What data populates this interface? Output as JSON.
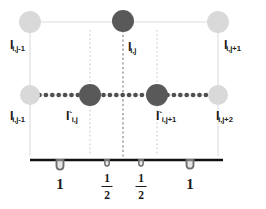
{
  "figure": {
    "canvas": {
      "width": 266,
      "height": 209
    },
    "colors": {
      "node_light": "#d9d9d9",
      "node_dark": "#595959",
      "grid_line": "#d6d6d6",
      "dotted_grid": "#d0d0d0",
      "stencil_line": "#4d4d4d",
      "axis": "#000000",
      "text": "#1a1a1a"
    }
  },
  "nodes": [
    {
      "id": "top-left",
      "label_key": "n0",
      "shade": "light",
      "x": 30,
      "y": 22,
      "r": 11
    },
    {
      "id": "top-center",
      "label_key": "n1",
      "shade": "dark",
      "x": 123,
      "y": 21,
      "r": 11
    },
    {
      "id": "top-right",
      "label_key": "n2",
      "shade": "light",
      "x": 218,
      "y": 22,
      "r": 11
    },
    {
      "id": "mid-left",
      "label_key": "n3",
      "shade": "light",
      "x": 30,
      "y": 95,
      "r": 10
    },
    {
      "id": "mid-inner-left",
      "label_key": "n4",
      "shade": "dark",
      "x": 90,
      "y": 95,
      "r": 11
    },
    {
      "id": "mid-inner-right",
      "label_key": "n5",
      "shade": "dark",
      "x": 157,
      "y": 95,
      "r": 11
    },
    {
      "id": "mid-right",
      "label_key": "n6",
      "shade": "light",
      "x": 218,
      "y": 95,
      "r": 10
    }
  ],
  "labels": {
    "n0": {
      "base": "I",
      "sub": "i,j-1",
      "prime": "",
      "x": 10,
      "y": 39
    },
    "n1": {
      "base": "I",
      "sub": "i,j",
      "prime": "",
      "x": 128,
      "y": 41
    },
    "n2": {
      "base": "I",
      "sub": "i,j+1",
      "prime": "",
      "x": 224,
      "y": 39
    },
    "n3": {
      "base": "I",
      "sub": "i,j-1",
      "prime": "",
      "x": 10,
      "y": 110
    },
    "n4": {
      "base": "I",
      "sub": "i,j",
      "prime": "`",
      "x": 66,
      "y": 110
    },
    "n5": {
      "base": "I",
      "sub": "i,j+1",
      "prime": "`",
      "x": 156,
      "y": 110
    },
    "n6": {
      "base": "I",
      "sub": "i,j+2",
      "prime": "",
      "x": 216,
      "y": 110
    }
  },
  "axis": {
    "name": "spacing-axis",
    "x_start": 30,
    "x_end": 223,
    "y": 160,
    "ticks": [
      {
        "id": "tick-1",
        "x": 60,
        "glyph": "u-marker",
        "size": "large"
      },
      {
        "id": "tick-2",
        "x": 107,
        "glyph": "u-marker",
        "size": "small"
      },
      {
        "id": "tick-3",
        "x": 141,
        "glyph": "u-marker",
        "size": "small"
      },
      {
        "id": "tick-4",
        "x": 190,
        "glyph": "u-marker",
        "size": "large"
      }
    ]
  },
  "spacings": [
    {
      "id": "spacing-1",
      "kind": "whole",
      "value": "1",
      "numerator": "",
      "denominator": "",
      "x": 60,
      "y": 177
    },
    {
      "id": "spacing-2",
      "kind": "fraction",
      "value": "1/2",
      "numerator": "1",
      "denominator": "2",
      "x": 107,
      "y": 175
    },
    {
      "id": "spacing-3",
      "kind": "fraction",
      "value": "1/2",
      "numerator": "1",
      "denominator": "2",
      "x": 141,
      "y": 175
    },
    {
      "id": "spacing-4",
      "kind": "whole",
      "value": "1",
      "numerator": "",
      "denominator": "",
      "x": 190,
      "y": 177
    }
  ],
  "grid": {
    "horizontal_lines": [
      {
        "id": "grid-row-top",
        "y": 22,
        "x1": 30,
        "x2": 218,
        "style": "solid-light"
      },
      {
        "id": "grid-row-mid",
        "y": 95,
        "x1": 30,
        "x2": 218,
        "style": "solid-light"
      }
    ],
    "vertical_lines": [
      {
        "id": "grid-col-left",
        "x": 30,
        "y1": 22,
        "y2": 155,
        "style": "solid-light"
      },
      {
        "id": "grid-col-inner-left",
        "x": 90,
        "y1": 30,
        "y2": 155,
        "style": "dotted-light"
      },
      {
        "id": "grid-col-center",
        "x": 123,
        "y1": 21,
        "y2": 158,
        "style": "dotted-dark"
      },
      {
        "id": "grid-col-inner-right",
        "x": 157,
        "y1": 30,
        "y2": 155,
        "style": "dotted-light"
      },
      {
        "id": "grid-col-right",
        "x": 218,
        "y1": 22,
        "y2": 155,
        "style": "solid-light"
      }
    ],
    "stencil_line": {
      "id": "stencil-dotted-row",
      "y": 95,
      "x1": 33,
      "x2": 216,
      "style": "thick-dotted"
    }
  }
}
